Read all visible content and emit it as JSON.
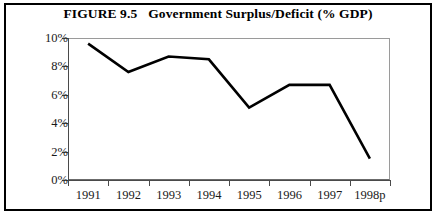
{
  "figure": {
    "number_label": "FIGURE 9.5",
    "title": "Government Surplus/Deficit (% GDP)",
    "full_title": "FIGURE 9.5   Government Surplus/Deficit (% GDP)"
  },
  "colors": {
    "line": "#000000",
    "axis": "#4a4a4a",
    "frame": "#9a9a9a",
    "outer_border": "#000000",
    "text": "#1a1a1a",
    "background": "#ffffff"
  },
  "chart_data": {
    "type": "line",
    "xlabel": "",
    "ylabel": "",
    "categories": [
      "1991",
      "1992",
      "1993",
      "1994",
      "1995",
      "1996",
      "1997",
      "1998p"
    ],
    "values": [
      9.6,
      7.6,
      8.7,
      8.5,
      5.1,
      6.7,
      6.7,
      1.5
    ],
    "series": [
      {
        "name": "Government Surplus/Deficit (% GDP)",
        "values": [
          9.6,
          7.6,
          8.7,
          8.5,
          5.1,
          6.7,
          6.7,
          1.5
        ]
      }
    ],
    "ylim": [
      0,
      10
    ],
    "ytick_values": [
      0,
      2,
      4,
      6,
      8,
      10
    ],
    "ytick_labels": [
      "0%",
      "2%",
      "4%",
      "6%",
      "8%",
      "10%"
    ],
    "xtick_labels": [
      "1991",
      "1992",
      "1993",
      "1994",
      "1995",
      "1996",
      "1997",
      "1998p"
    ],
    "grid": false,
    "legend": null,
    "legend_position": "none",
    "annotations": []
  }
}
